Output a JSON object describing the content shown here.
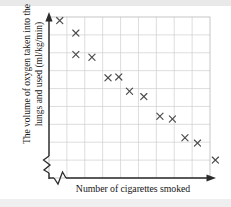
{
  "figure": {
    "axis_labels": {
      "y_line1": "The volume of oxygen taken into the",
      "y_line2": "lungs and used (ml/kg/min)",
      "x": "Number of cigarettes smoked"
    },
    "colors": {
      "grid": "#cfcfcf",
      "axis": "#2b2b2b",
      "marker": "#4a4a4a",
      "background": "#ffffff",
      "plot_border": "#b8b8b8"
    },
    "features": {
      "y_axis_break": "zigzag",
      "x_axis_break": "zigzag",
      "y_axis_arrowhead": "up",
      "x_axis_arrowhead": "right",
      "grid": "on",
      "tick_labels": "none",
      "marker_style": "cross"
    }
  },
  "chart_data": {
    "type": "scatter",
    "title": "",
    "xlabel": "Number of cigarettes smoked",
    "ylabel": "The volume of oxygen taken into the lungs and used (ml/kg/min)",
    "xlim": [
      0,
      9
    ],
    "ylim": [
      0,
      9
    ],
    "grid": true,
    "legend": "none",
    "marker": "x",
    "correlation": "negative",
    "points": [
      {
        "x": 0.6,
        "y": 8.8
      },
      {
        "x": 1.5,
        "y": 8.1
      },
      {
        "x": 1.5,
        "y": 6.9
      },
      {
        "x": 2.4,
        "y": 6.75
      },
      {
        "x": 3.3,
        "y": 5.6
      },
      {
        "x": 3.9,
        "y": 5.65
      },
      {
        "x": 4.5,
        "y": 4.85
      },
      {
        "x": 5.3,
        "y": 4.55
      },
      {
        "x": 6.2,
        "y": 3.45
      },
      {
        "x": 6.9,
        "y": 3.3
      },
      {
        "x": 7.6,
        "y": 2.25
      },
      {
        "x": 8.3,
        "y": 1.95
      },
      {
        "x": 9.3,
        "y": 1.0
      }
    ]
  }
}
